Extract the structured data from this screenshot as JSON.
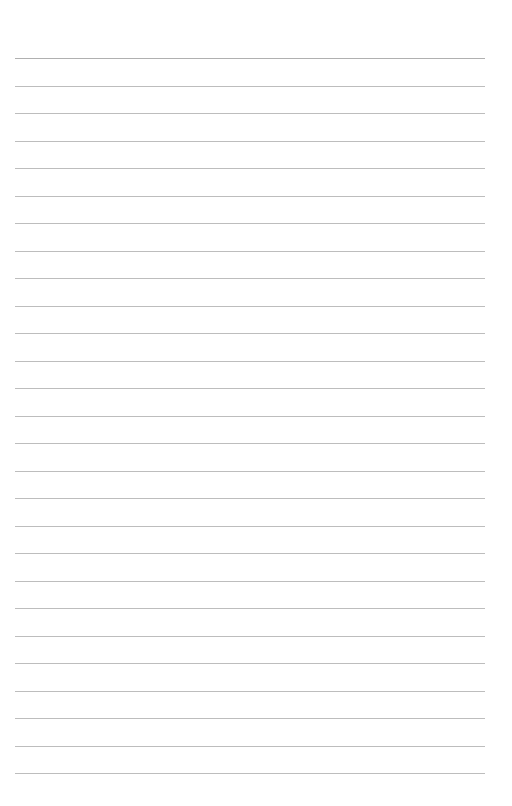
{
  "page": {
    "type": "blank-lined-paper",
    "background": "#ffffff",
    "line_color": "#bdbdbd",
    "line_count": 27,
    "first_line_y": 58,
    "line_spacing": 27.5,
    "line_left": 15,
    "line_width": 470
  }
}
